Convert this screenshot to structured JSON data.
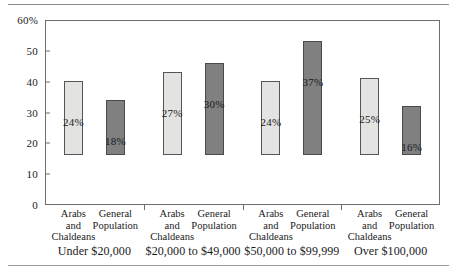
{
  "chart_data": {
    "type": "bar",
    "title": "",
    "subtitle": "",
    "xlabel": "",
    "ylabel": "",
    "ylim": [
      0,
      60
    ],
    "yticks": [
      0,
      10,
      20,
      30,
      40,
      50,
      60
    ],
    "ytick_labels": [
      "0",
      "10",
      "20",
      "30",
      "40",
      "50",
      "60%"
    ],
    "grid": false,
    "legend_position": "none",
    "categories": [
      "Under $20,000",
      "$20,000 to $49,000",
      "$50,000 to $99,999",
      "Over $100,000"
    ],
    "series": [
      {
        "name": "Arabs and Chaldeans",
        "color": "#e3e3e1",
        "values": [
          24,
          27,
          24,
          25
        ],
        "value_labels": [
          "24%",
          "27%",
          "24%",
          "25%"
        ]
      },
      {
        "name": "General Population",
        "color": "#808080",
        "values": [
          18,
          30,
          37,
          16
        ],
        "value_labels": [
          "18%",
          "30%",
          "37%",
          "16%"
        ]
      }
    ],
    "series_tick_labels": [
      [
        "Arabs",
        "and",
        "Chaldeans"
      ],
      [
        "General",
        "Population"
      ]
    ]
  },
  "axis": {
    "y_labels": [
      "60%",
      "50",
      "40",
      "30",
      "20",
      "10",
      "0"
    ]
  },
  "groups": [
    {
      "label": "Under $20,000",
      "bars": [
        {
          "series": "Arabs and Chaldeans",
          "value": 24,
          "label": "24%",
          "tone": "light",
          "tick": [
            "Arabs",
            "and",
            "Chaldeans"
          ]
        },
        {
          "series": "General Population",
          "value": 18,
          "label": "18%",
          "tone": "dark",
          "tick": [
            "General",
            "Population"
          ]
        }
      ]
    },
    {
      "label": "$20,000 to $49,000",
      "bars": [
        {
          "series": "Arabs and Chaldeans",
          "value": 27,
          "label": "27%",
          "tone": "light",
          "tick": [
            "Arabs",
            "and",
            "Chaldeans"
          ]
        },
        {
          "series": "General Population",
          "value": 30,
          "label": "30%",
          "tone": "dark",
          "tick": [
            "General",
            "Population"
          ]
        }
      ]
    },
    {
      "label": "$50,000 to $99,999",
      "bars": [
        {
          "series": "Arabs and Chaldeans",
          "value": 24,
          "label": "24%",
          "tone": "light",
          "tick": [
            "Arabs",
            "and",
            "Chaldeans"
          ]
        },
        {
          "series": "General Population",
          "value": 37,
          "label": "37%",
          "tone": "dark",
          "tick": [
            "General",
            "Population"
          ]
        }
      ]
    },
    {
      "label": "Over $100,000",
      "bars": [
        {
          "series": "Arabs and Chaldeans",
          "value": 25,
          "label": "25%",
          "tone": "light",
          "tick": [
            "Arabs",
            "and",
            "Chaldeans"
          ]
        },
        {
          "series": "General Population",
          "value": 16,
          "label": "16%",
          "tone": "dark",
          "tick": [
            "General",
            "Population"
          ]
        }
      ]
    }
  ],
  "colors": {
    "light_bar": "#e3e3e1",
    "dark_bar": "#808080",
    "frame": "#6f6f6f",
    "rule": "#8a8a8a",
    "text": "#1a1a1a"
  }
}
